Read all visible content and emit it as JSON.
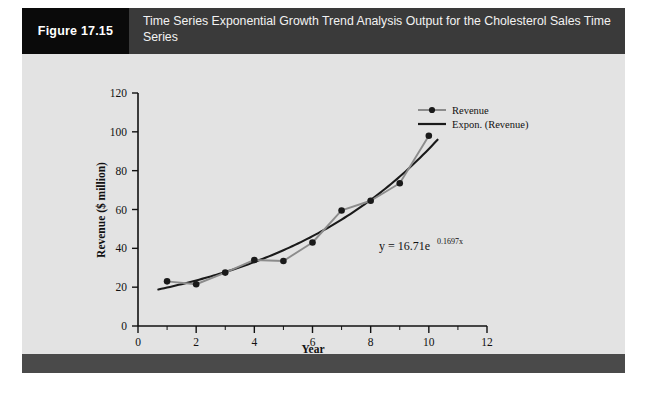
{
  "figure": {
    "number_label": "Figure 17.15",
    "title": "Time Series Exponential Growth Trend Analysis Output for the Cholesterol Sales Time Series",
    "colors": {
      "number_block_bg": "#0a0a0a",
      "title_bar_bg": "#3a3a3a",
      "panel_bg": "#e3e3e3",
      "footer_bar_bg": "#4a4a4a",
      "series_line": "#8c8c8c",
      "marker": "#1a1a1a",
      "trend_line": "#1a1a1a",
      "axis": "#111111"
    }
  },
  "chart_data": {
    "type": "line",
    "title": "",
    "xlabel": "Year",
    "ylabel": "Revenue ($ million)",
    "xlim": [
      0,
      12
    ],
    "ylim": [
      0,
      120
    ],
    "xticks": [
      0,
      2,
      4,
      6,
      8,
      10,
      12
    ],
    "yticks": [
      0,
      20,
      40,
      60,
      80,
      100,
      120
    ],
    "x_minor_step": 1,
    "grid": false,
    "legend_position": "top-right",
    "x": [
      1,
      2,
      3,
      4,
      5,
      6,
      7,
      8,
      9,
      10
    ],
    "series": [
      {
        "name": "Revenue",
        "style": "line-with-markers",
        "values": [
          23,
          21.5,
          27.5,
          34,
          33.5,
          43,
          59.5,
          64.5,
          73.5,
          98
        ]
      },
      {
        "name": "Expon. (Revenue)",
        "style": "smooth-line",
        "equation_form": "y = 16.71e^(0.1697x)",
        "coefficient": 16.71,
        "exponent_rate": 0.1697,
        "values": [
          19.8,
          23.5,
          27.8,
          32.9,
          39.0,
          46.2,
          54.7,
          64.8,
          76.8,
          91.0
        ]
      }
    ],
    "annotations": [
      {
        "name": "trendline-equation",
        "text_prefix": "y = 16.71e",
        "text_superscript": "0.1697x",
        "x_data": 6.0,
        "y_data": 45
      }
    ],
    "legend_entries": [
      "Revenue",
      "Expon. (Revenue)"
    ]
  }
}
